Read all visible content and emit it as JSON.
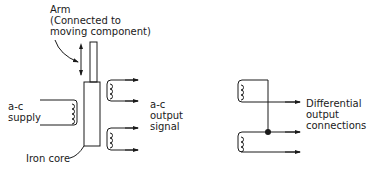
{
  "diagram": {
    "type": "LVDT schematic",
    "colors": {
      "ink": "#1a1a1a",
      "background": "#ffffff"
    },
    "labels": {
      "arm": {
        "line1": "Arm",
        "line2": "(Connected to",
        "line3": "moving component)"
      },
      "supply": {
        "line1": "a-c",
        "line2": "supply"
      },
      "output": {
        "line1": "a-c",
        "line2": "output",
        "line3": "signal"
      },
      "core": {
        "line1": "Iron core"
      },
      "differential": {
        "line1": "Differential",
        "line2": "output",
        "line3": "connections"
      }
    },
    "components": [
      {
        "id": "arm",
        "label": "Arm"
      },
      {
        "id": "iron-core",
        "label": "Iron core"
      },
      {
        "id": "primary-coil",
        "label": "a-c supply"
      },
      {
        "id": "secondary-coil-top",
        "label": "a-c output signal"
      },
      {
        "id": "secondary-coil-bottom",
        "label": "a-c output signal"
      },
      {
        "id": "differential-coil-top",
        "label": "Differential output connections"
      },
      {
        "id": "differential-coil-bottom",
        "label": "Differential output connections"
      },
      {
        "id": "junction-node",
        "label": ""
      }
    ]
  }
}
